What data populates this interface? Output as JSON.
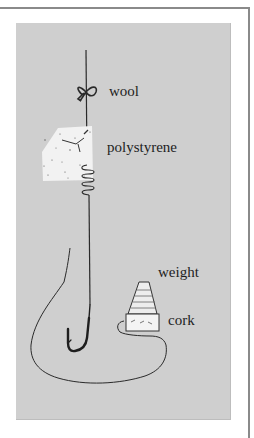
{
  "figure": {
    "labels": {
      "wool": "wool",
      "polystyrene": "polystyrene",
      "weight": "weight",
      "cork": "cork"
    },
    "colors": {
      "panel_background": "#cfcfcf",
      "line": "#2a2a2a",
      "frame": "#8a8a8a",
      "polystyrene_fill": "#f2f2f2",
      "weight_fill": "#ededed"
    }
  }
}
